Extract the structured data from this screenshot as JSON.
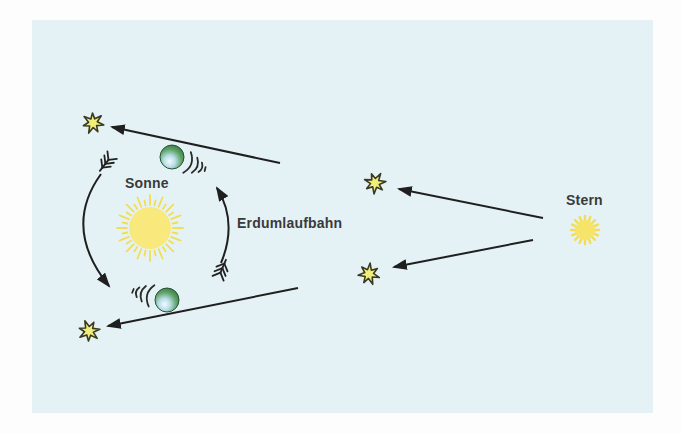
{
  "diagram": {
    "labels": {
      "sun": "Sonne",
      "earth_orbit": "Erdumlaufbahn",
      "star": "Stern"
    },
    "icons": {
      "sun": "sun-icon",
      "distant_star": "fuzzy-star-icon",
      "apparent_star_position": "starburst-icon",
      "earth": "earth-globe-icon",
      "orbit_direction": "feathered-orbit-arrow-icon",
      "earth_motion_trail": "motion-lines-icon",
      "light_ray": "light-ray-arrow-icon"
    },
    "colors": {
      "page_bg": "#fdfdfd",
      "panel_bg": "#e4f2f6",
      "sun_disk": "#f9e87c",
      "sun_rays": "#f3dd55",
      "fuzzy_star": "#f6e468",
      "star_fill": "#f1ee79",
      "star_outline": "#3a3a22",
      "line": "#1f1f1f",
      "text": "#3a3a3a",
      "earth_dark": "#2e6b3d",
      "earth_light": "#eff9fb"
    }
  }
}
